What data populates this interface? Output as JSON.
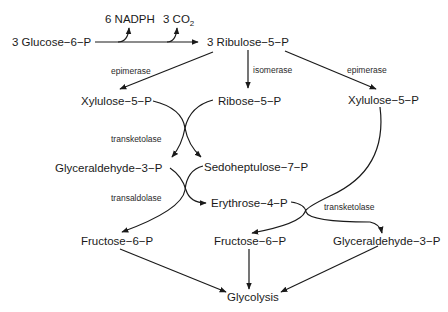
{
  "diagram": {
    "nodes": {
      "glucose6p": "3 Glucose−6−P",
      "nadph": "6 NADPH",
      "co2_prefix": "3 CO",
      "co2_sub": "2",
      "ribulose5p": "3 Ribulose−5−P",
      "xylulose5p_left": "Xylulose−5−P",
      "ribose5p": "Ribose−5−P",
      "xylulose5p_right": "Xylulose−5−P",
      "glyceraldehyde3p_left": "Glyceraldehyde−3−P",
      "sedoheptulose7p": "Sedoheptulose−7−P",
      "erythrose4p": "Erythrose−4−P",
      "fructose6p_left": "Fructose−6−P",
      "fructose6p_mid": "Fructose−6−P",
      "glyceraldehyde3p_right": "Glyceraldehyde−3−P",
      "glycolysis": "Glycolysis"
    },
    "enzymes": {
      "epimerase_left": "epimerase",
      "isomerase": "isomerase",
      "epimerase_right": "epimerase",
      "transketolase_1": "transketolase",
      "transaldolase": "transaldolase",
      "transketolase_2": "transketolase"
    },
    "edges": [
      {
        "from": "3 Glucose-6-P",
        "to": "3 Ribulose-5-P",
        "side_products": [
          "6 NADPH",
          "3 CO2"
        ]
      },
      {
        "from": "3 Ribulose-5-P",
        "to": "Xylulose-5-P (left)",
        "enzyme": "epimerase"
      },
      {
        "from": "3 Ribulose-5-P",
        "to": "Ribose-5-P",
        "enzyme": "isomerase"
      },
      {
        "from": "3 Ribulose-5-P",
        "to": "Xylulose-5-P (right)",
        "enzyme": "epimerase"
      },
      {
        "from": [
          "Xylulose-5-P",
          "Ribose-5-P"
        ],
        "to": [
          "Glyceraldehyde-3-P",
          "Sedoheptulose-7-P"
        ],
        "enzyme": "transketolase"
      },
      {
        "from": [
          "Glyceraldehyde-3-P",
          "Sedoheptulose-7-P"
        ],
        "to": [
          "Fructose-6-P",
          "Erythrose-4-P"
        ],
        "enzyme": "transaldolase"
      },
      {
        "from": [
          "Erythrose-4-P",
          "Xylulose-5-P"
        ],
        "to": [
          "Fructose-6-P",
          "Glyceraldehyde-3-P"
        ],
        "enzyme": "transketolase"
      },
      {
        "from": "Fructose-6-P (left)",
        "to": "Glycolysis"
      },
      {
        "from": "Fructose-6-P (middle)",
        "to": "Glycolysis"
      },
      {
        "from": "Glyceraldehyde-3-P (right)",
        "to": "Glycolysis"
      }
    ]
  }
}
